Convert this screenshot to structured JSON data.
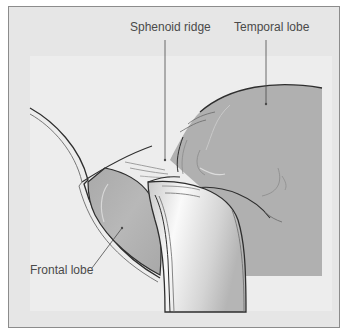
{
  "diagram": {
    "type": "anatomical-illustration",
    "labels": {
      "sphenoid_ridge": "Sphenoid ridge",
      "temporal_lobe": "Temporal lobe",
      "frontal_lobe": "Frontal lobe"
    },
    "colors": {
      "frame_background": "#e6e6e6",
      "inner_panel": "#ededed",
      "brain_tissue": "#b0b0b0",
      "outline": "#2e2e2e",
      "frame_border": "#8c8c8c"
    }
  }
}
